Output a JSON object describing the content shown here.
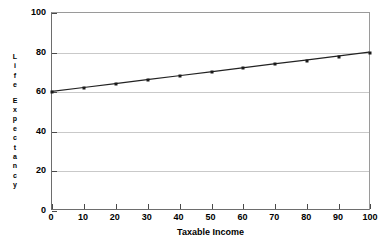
{
  "chart_data": {
    "type": "line",
    "title": "",
    "subtitle": "",
    "xlabel": "Taxable Income",
    "ylabel": "Life Expectancy",
    "ylabel_chars": [
      "L",
      "i",
      "f",
      "e",
      "",
      "E",
      "x",
      "p",
      "e",
      "c",
      "t",
      "a",
      "n",
      "c",
      "y"
    ],
    "x": [
      0,
      10,
      20,
      30,
      40,
      50,
      60,
      70,
      80,
      90,
      100
    ],
    "values": [
      60,
      62,
      64,
      66,
      68,
      70,
      72,
      74,
      76,
      78,
      80
    ],
    "series": [
      {
        "name": "Life Expectancy",
        "values": [
          60,
          62,
          64,
          66,
          68,
          70,
          72,
          74,
          76,
          78,
          80
        ]
      }
    ],
    "xlim": [
      0,
      100
    ],
    "ylim": [
      0,
      100
    ],
    "xticks": [
      0,
      10,
      20,
      30,
      40,
      50,
      60,
      70,
      80,
      90,
      100
    ],
    "yticks": [
      0,
      20,
      40,
      60,
      80,
      100
    ],
    "xticklabels": [
      "0",
      "10",
      "20",
      "30",
      "40",
      "50",
      "60",
      "70",
      "80",
      "90",
      "100"
    ],
    "yticklabels": [
      "0",
      "20",
      "40",
      "60",
      "80",
      "100"
    ],
    "grid": "horizontal",
    "legend": "none",
    "marker": "square",
    "line_color": "#222222",
    "marker_color": "#1a1a1a",
    "grid_color": "#c9c9c9",
    "axis_color": "#6d6d6d",
    "background_color": "#ffffff"
  }
}
